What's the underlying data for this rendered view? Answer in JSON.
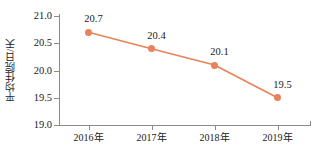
{
  "chart_data": {
    "type": "line",
    "title": "",
    "xlabel": "",
    "ylabel": "平均住院日/天",
    "categories": [
      "2016年",
      "2017年",
      "2018年",
      "2019年"
    ],
    "values": [
      20.7,
      20.4,
      20.1,
      19.5
    ],
    "point_labels": [
      "20.7",
      "20.4",
      "20.1",
      "19.5"
    ],
    "ylim": [
      19.0,
      21.0
    ],
    "yticks": [
      21.0,
      20.5,
      20.0,
      19.5,
      19.0
    ],
    "ytick_labels": [
      "21.0",
      "20.5",
      "20.0",
      "19.5",
      "19.0"
    ],
    "grid": false,
    "legend": false,
    "series_color": "#e8825a",
    "axis_color": "#8a8a8a",
    "text_color": "#1a1a1a",
    "background_color": "#ffffff"
  }
}
